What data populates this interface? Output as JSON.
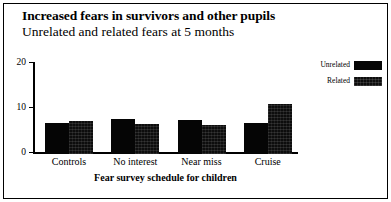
{
  "figure": {
    "title": "Increased fears in survivors and other pupils",
    "subtitle": "Unrelated and related fears at 5 months",
    "border_color": "#000000",
    "background": "#ffffff"
  },
  "chart_data": {
    "type": "bar",
    "title": "Increased fears in survivors and other pupils",
    "subtitle": "Unrelated and related fears at 5 months",
    "xlabel": "Fear survey schedule for children",
    "ylabel": "",
    "categories": [
      "Controls",
      "No interest",
      "Near miss",
      "Cruise"
    ],
    "series": [
      {
        "name": "Unrelated",
        "color": "#050505",
        "values": [
          6.8,
          7.7,
          7.5,
          7.0
        ]
      },
      {
        "name": "Related",
        "color": "#0d0d0d",
        "values": [
          7.3,
          6.6,
          6.4,
          11.2
        ]
      }
    ],
    "ylim": [
      0,
      20
    ],
    "yticks": [
      0,
      10,
      20
    ],
    "ytick_labels": [
      "0",
      "10",
      "20"
    ],
    "grid": false,
    "legend_position": "right"
  },
  "legend": {
    "items": [
      {
        "label": "Unrelated"
      },
      {
        "label": "Related"
      }
    ]
  },
  "axes": {
    "y_ticks": [
      {
        "label": "20",
        "value": 20
      },
      {
        "label": "10",
        "value": 10
      },
      {
        "label": "0",
        "value": 0
      }
    ],
    "x_title": "Fear survey schedule for children",
    "x_categories": [
      "Controls",
      "No interest",
      "Near miss",
      "Cruise"
    ]
  }
}
